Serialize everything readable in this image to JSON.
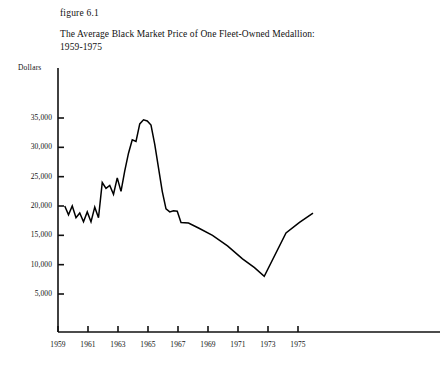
{
  "figure": {
    "number_label": "figure 6.1",
    "title_line1": "The Average Black Market Price of One Fleet-Owned Medallion:",
    "title_line2": "1959-1975",
    "y_unit_label": "Dollars"
  },
  "colors": {
    "background": "#ffffff",
    "ink": "#111111",
    "line": "#000000"
  },
  "chart_data": {
    "type": "line",
    "title": "The Average Black Market Price of One Fleet-Owned Medallion: 1959-1975",
    "xlabel": "",
    "ylabel": "Dollars",
    "xlim": [
      1959,
      1976.2
    ],
    "ylim": [
      0,
      37000
    ],
    "grid": false,
    "legend": "none",
    "x_ticks": [
      1959,
      1961,
      1963,
      1965,
      1967,
      1969,
      1971,
      1973,
      1975
    ],
    "x_tick_labels": [
      "1959",
      "1961",
      "1963",
      "1965",
      "1967",
      "1969",
      "1971",
      "1973",
      "1975"
    ],
    "y_ticks": [
      5000,
      10000,
      15000,
      20000,
      25000,
      30000,
      35000
    ],
    "y_tick_labels": [
      "5,000",
      "10,000",
      "15,000",
      "20,000",
      "25,000",
      "30,000",
      "35,000"
    ],
    "series": [
      {
        "name": "Average black market price of one fleet-owned medallion",
        "x": [
          1959.45,
          1959.7,
          1959.95,
          1960.2,
          1960.45,
          1960.7,
          1960.95,
          1961.2,
          1961.45,
          1961.7,
          1961.95,
          1962.2,
          1962.45,
          1962.7,
          1962.95,
          1963.2,
          1963.45,
          1963.7,
          1963.95,
          1964.2,
          1964.45,
          1964.7,
          1964.95,
          1965.2,
          1965.45,
          1965.7,
          1965.95,
          1966.2,
          1966.45,
          1966.7,
          1966.95,
          1967.2,
          1967.7,
          1968.4,
          1969.3,
          1970.3,
          1971.3,
          1972.1,
          1972.75,
          1974.2,
          1975.1,
          1976.0
        ],
        "values": [
          20000,
          18500,
          20000,
          18000,
          18800,
          17300,
          19000,
          17300,
          19800,
          18000,
          24000,
          23000,
          23500,
          22000,
          24800,
          22500,
          26000,
          29000,
          31300,
          31000,
          34000,
          34700,
          34500,
          33800,
          30500,
          26500,
          22500,
          19500,
          19000,
          19200,
          19100,
          17200,
          17100,
          16200,
          15000,
          13200,
          11000,
          9500,
          8000,
          15400,
          17200,
          18800
        ]
      }
    ]
  }
}
